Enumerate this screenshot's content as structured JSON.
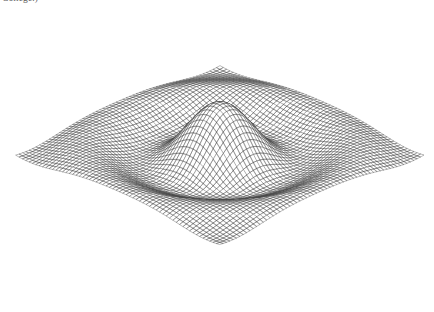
{
  "page": {
    "width": 434,
    "height": 312,
    "background_color": "#ffffff"
  },
  "caption": {
    "text_fragment": "College.)"
  },
  "figure": {
    "name": "3d-wireframe-surface-plot",
    "line_color": "#4a4a4a",
    "fill_color": "#ffffff",
    "hidden_line_removal": true
  },
  "chart_data": {
    "type": "surface",
    "title": "",
    "subtitle": "",
    "xlabel": "",
    "ylabel": "",
    "zlabel": "",
    "grid": false,
    "legend": null,
    "axes_visible": false,
    "tick_labels": [],
    "annotations": [],
    "function": "z = sin(r) / r  with r = sqrt(x^2 + y^2), sampled on a square domain",
    "formula_scale": 2.55,
    "x": {
      "min": -8.2,
      "max": 8.2,
      "samples": 62
    },
    "y": {
      "min": -8.2,
      "max": 8.2,
      "samples": 62
    },
    "zlim": [
      -0.24,
      1.0
    ],
    "peak": {
      "x": 0,
      "y": 0,
      "z": 1.0
    },
    "trough_radius": 4.49,
    "trough_z": -0.217,
    "secondary_ring_radius": 7.73,
    "secondary_ring_z": 0.128,
    "projection": {
      "type": "orthographic",
      "azimuth_deg": 315,
      "elevation_deg": 26,
      "z_exaggeration": 1.0
    },
    "render": {
      "u_lines": 62,
      "v_lines": 62,
      "stroke_width": 0.38
    }
  }
}
